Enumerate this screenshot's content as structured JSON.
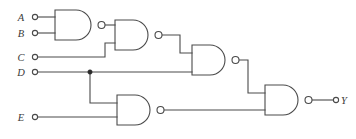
{
  "figure": {
    "background_color": "#ffffff",
    "line_color": "#4a4a4a",
    "width": 356,
    "height": 139
  },
  "inputs": [
    {
      "id": "A",
      "label": "A",
      "terminal_x": 33,
      "terminal_y": 17,
      "wire_to_x": 55
    },
    {
      "id": "B",
      "label": "B",
      "terminal_x": 33,
      "terminal_y": 33,
      "wire_to_x": 55
    },
    {
      "id": "C",
      "label": "C",
      "terminal_x": 33,
      "terminal_y": 57,
      "wire_to_x": 115
    },
    {
      "id": "D",
      "label": "D",
      "terminal_x": 33,
      "terminal_y": 72,
      "wire_to_x": 192
    },
    {
      "id": "E",
      "label": "E",
      "terminal_x": 33,
      "terminal_y": 117,
      "wire_to_x": 117
    }
  ],
  "outputs": [
    {
      "id": "Y",
      "label": "Y",
      "terminal_x": 337,
      "terminal_y": 100
    }
  ],
  "gates": [
    {
      "id": "G1",
      "type": "NAND",
      "inputs": [
        "A",
        "B"
      ],
      "output": "n1",
      "body_left": 55,
      "body_top": 10,
      "body_right": 98,
      "body_bottom": 40,
      "bubble_cx": 101.5,
      "bubble_cy": 25,
      "bubble_r": 3.5
    },
    {
      "id": "G2",
      "type": "NAND",
      "inputs": [
        "n1",
        "C"
      ],
      "output": "n2",
      "body_left": 115,
      "body_top": 20,
      "body_right": 155,
      "body_bottom": 50,
      "bubble_cx": 158.5,
      "bubble_cy": 35,
      "bubble_r": 3.5
    },
    {
      "id": "G3",
      "type": "NAND",
      "inputs": [
        "n2",
        "D"
      ],
      "output": "n3",
      "body_left": 192,
      "body_top": 45,
      "body_right": 232,
      "body_bottom": 75,
      "bubble_cx": 235.5,
      "bubble_cy": 60,
      "bubble_r": 3.5
    },
    {
      "id": "G4",
      "type": "NAND",
      "inputs": [
        "D",
        "E"
      ],
      "output": "n4",
      "body_left": 117,
      "body_top": 95,
      "body_right": 157,
      "body_bottom": 125,
      "bubble_cx": 160.5,
      "bubble_cy": 110,
      "bubble_r": 3.5
    },
    {
      "id": "G5",
      "type": "NAND",
      "inputs": [
        "n3",
        "n4"
      ],
      "output": "Y",
      "body_left": 265,
      "body_top": 85,
      "body_right": 305,
      "body_bottom": 115,
      "bubble_cx": 308.5,
      "bubble_cy": 100,
      "bubble_r": 3.5
    }
  ],
  "junctions": [
    {
      "id": "D-branch",
      "x": 90,
      "y": 72,
      "r": 2.2
    }
  ],
  "nets": [
    {
      "id": "A-in",
      "path": "M 38 17 L 55 17"
    },
    {
      "id": "B-in",
      "path": "M 38 33 L 55 33"
    },
    {
      "id": "C-in",
      "path": "M 38 57 L 105 57 L 105 43 L 115 43"
    },
    {
      "id": "D-in",
      "path": "M 38 72 L 192 72"
    },
    {
      "id": "E-in",
      "path": "M 38 117 L 117 117"
    },
    {
      "id": "n1",
      "path": "M 105 25 L 115 25"
    },
    {
      "id": "n2",
      "path": "M 162 35 L 180 35 L 180 53 L 192 53"
    },
    {
      "id": "n3",
      "path": "M 239 60 L 248 60 L 248 93 L 265 93"
    },
    {
      "id": "n4",
      "path": "M 164 110 L 265 110"
    },
    {
      "id": "D-down",
      "path": "M 90 72 L 90 103 L 117 103"
    },
    {
      "id": "Y-out",
      "path": "M 312 100 L 334 100"
    }
  ]
}
